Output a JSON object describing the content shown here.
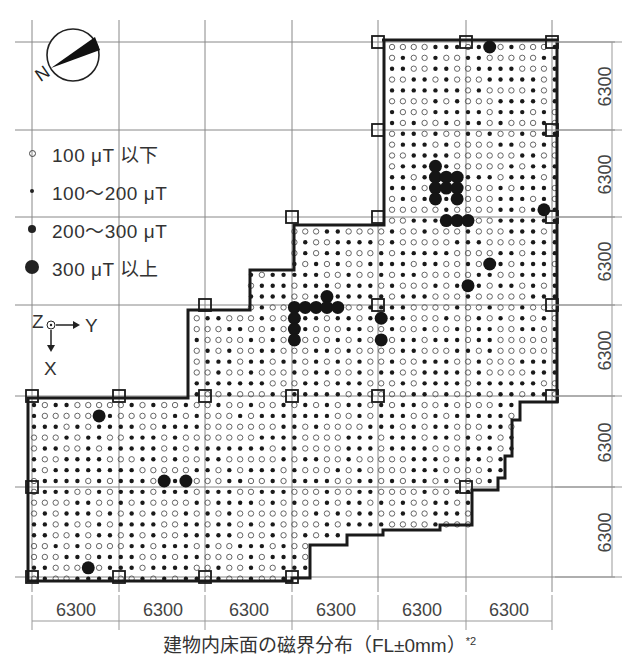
{
  "figure": {
    "caption": "建物内床面の磁界分布（FL±0mm）",
    "caption_note": "*2",
    "compass": {
      "label": "N",
      "icon": "north-arrow-compass"
    },
    "axes": {
      "z": "Z",
      "y": "Y",
      "x": "X"
    }
  },
  "legend": {
    "items": [
      {
        "label": "100 μT 以下",
        "symbol": "open-circle",
        "r": 2.8
      },
      {
        "label": "100〜200 μT",
        "symbol": "small-dot",
        "r": 2.2
      },
      {
        "label": "200〜300 μT",
        "symbol": "medium-dot",
        "r": 4
      },
      {
        "label": "300 μT 以上",
        "symbol": "large-dot",
        "r": 7
      }
    ]
  },
  "dimensions": {
    "horizontal": [
      "6300",
      "6300",
      "6300",
      "6300",
      "6300",
      "6300"
    ],
    "vertical": [
      "6300",
      "6300",
      "6300",
      "6300",
      "6300",
      "6300"
    ],
    "unit_mm": 6300
  },
  "colors": {
    "line": "#222222",
    "grid": "#777777",
    "dim": "#888888",
    "dot": "#1a1a1a"
  },
  "chart_data": {
    "type": "heatmap",
    "title": "建物内床面の磁界分布（FL±0mm）*2",
    "xlabel": "Y",
    "ylabel": "X",
    "grid_bays_x": 6,
    "grid_bays_y": 6,
    "bay_size_mm": 6300,
    "categories": [
      "100 μT 以下",
      "100〜200 μT",
      "200〜300 μT",
      "300 μT 以上"
    ],
    "hotspots_300_plus": [
      {
        "area": "upper right, near x=485,y=52",
        "level": "300+"
      },
      {
        "area": "upper right cluster, x≈440-460, y≈160-210",
        "level": "300+"
      },
      {
        "area": "mid left cluster, x≈290-330, y≈307-345",
        "level": "300+"
      },
      {
        "area": "x≈378, y≈341",
        "level": "300+"
      },
      {
        "area": "x≈466, y≈285",
        "level": "300+"
      },
      {
        "area": "lower left, x≈160-182, y≈484",
        "level": "300+"
      },
      {
        "area": "lower left, x≈96, y≈418",
        "level": "300+"
      },
      {
        "area": "lower left, x≈86, y≈563",
        "level": "300+"
      }
    ]
  }
}
